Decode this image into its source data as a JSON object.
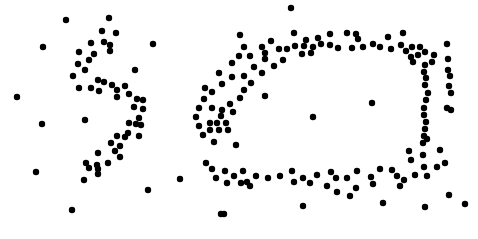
{
  "figure": {
    "title": "",
    "width": 478,
    "height": 239,
    "background_color": "#ffffff",
    "marker_color": "#000000",
    "marker_radius": 3.2
  },
  "chart_data": {
    "type": "scatter",
    "title": "",
    "subtitle": "",
    "xlabel": "",
    "ylabel": "",
    "xlim": [
      0,
      478
    ],
    "ylim": [
      239,
      0
    ],
    "grid": false,
    "legend": null,
    "axes_visible": false,
    "tick_labels_x": [],
    "tick_labels_y": [],
    "annotations": [],
    "point_color": "#000000",
    "point_marker": "circle",
    "point_size": 6.4,
    "series": [
      {
        "name": "s-curve-cluster",
        "color": "#000000",
        "points": [
          [
            66,
            20
          ],
          [
            109,
            18
          ],
          [
            102,
            31
          ],
          [
            116,
            33
          ],
          [
            104,
            42
          ],
          [
            91,
            43
          ],
          [
            110,
            45
          ],
          [
            110,
            51
          ],
          [
            79,
            52
          ],
          [
            94,
            54
          ],
          [
            89,
            60
          ],
          [
            78,
            64
          ],
          [
            85,
            70
          ],
          [
            73,
            76
          ],
          [
            98,
            80
          ],
          [
            104,
            82
          ],
          [
            112,
            85
          ],
          [
            79,
            88
          ],
          [
            91,
            88
          ],
          [
            99,
            91
          ],
          [
            117,
            90
          ],
          [
            135,
            70
          ],
          [
            125,
            86
          ],
          [
            129,
            94
          ],
          [
            117,
            97
          ],
          [
            137,
            99
          ],
          [
            143,
            100
          ],
          [
            134,
            107
          ],
          [
            143,
            109
          ],
          [
            139,
            118
          ],
          [
            129,
            123
          ],
          [
            136,
            124
          ],
          [
            141,
            125
          ],
          [
            128,
            133
          ],
          [
            139,
            136
          ],
          [
            125,
            137
          ],
          [
            117,
            136
          ],
          [
            111,
            143
          ],
          [
            120,
            146
          ],
          [
            115,
            151
          ],
          [
            98,
            153
          ],
          [
            120,
            157
          ],
          [
            86,
            163
          ],
          [
            97,
            165
          ],
          [
            108,
            163
          ],
          [
            89,
            168
          ],
          [
            98,
            169
          ],
          [
            98,
            174
          ],
          [
            84,
            180
          ]
        ]
      },
      {
        "name": "ellipse-ring-cluster",
        "color": "#000000",
        "points": [
          [
            291,
            8
          ],
          [
            294,
            33
          ],
          [
            347,
            33
          ],
          [
            330,
            34
          ],
          [
            356,
            34
          ],
          [
            403,
            33
          ],
          [
            240,
            35
          ],
          [
            306,
            40
          ],
          [
            318,
            38
          ],
          [
            271,
            41
          ],
          [
            304,
            46
          ],
          [
            358,
            39
          ],
          [
            388,
            37
          ],
          [
            313,
            47
          ],
          [
            321,
            44
          ],
          [
            295,
            46
          ],
          [
            363,
            47
          ],
          [
            330,
            45
          ],
          [
            373,
            44
          ],
          [
            380,
            47
          ],
          [
            401,
            45
          ],
          [
            412,
            47
          ],
          [
            420,
            47
          ],
          [
            244,
            47
          ],
          [
            262,
            47
          ],
          [
            279,
            49
          ],
          [
            287,
            49
          ],
          [
            338,
            48
          ],
          [
            352,
            48
          ],
          [
            391,
            49
          ],
          [
            406,
            51
          ],
          [
            425,
            52
          ],
          [
            418,
            55
          ],
          [
            265,
            53
          ],
          [
            302,
            54
          ],
          [
            311,
            53
          ],
          [
            239,
            56
          ],
          [
            250,
            56
          ],
          [
            411,
            57
          ],
          [
            447,
            44
          ],
          [
            413,
            62
          ],
          [
            434,
            55
          ],
          [
            432,
            62
          ],
          [
            425,
            65
          ],
          [
            448,
            59
          ],
          [
            424,
            72
          ],
          [
            448,
            70
          ],
          [
            450,
            76
          ],
          [
            426,
            78
          ],
          [
            425,
            85
          ],
          [
            449,
            86
          ],
          [
            451,
            93
          ],
          [
            428,
            93
          ],
          [
            426,
            100
          ],
          [
            424,
            108
          ],
          [
            447,
            108
          ],
          [
            451,
            110
          ],
          [
            424,
            115
          ],
          [
            426,
            122
          ],
          [
            425,
            129
          ],
          [
            424,
            136
          ],
          [
            427,
            139
          ],
          [
            423,
            143
          ],
          [
            409,
            151
          ],
          [
            423,
            155
          ],
          [
            440,
            150
          ],
          [
            411,
            160
          ],
          [
            424,
            167
          ],
          [
            437,
            167
          ],
          [
            445,
            163
          ],
          [
            415,
            175
          ],
          [
            427,
            176
          ],
          [
            397,
            176
          ],
          [
            404,
            180
          ],
          [
            380,
            169
          ],
          [
            392,
            170
          ],
          [
            371,
            177
          ],
          [
            357,
            171
          ],
          [
            347,
            178
          ],
          [
            331,
            172
          ],
          [
            336,
            178
          ],
          [
            317,
            175
          ],
          [
            303,
            178
          ],
          [
            292,
            171
          ],
          [
            280,
            176
          ],
          [
            268,
            178
          ],
          [
            256,
            176
          ],
          [
            247,
            182
          ],
          [
            243,
            171
          ],
          [
            234,
            176
          ],
          [
            225,
            171
          ],
          [
            216,
            178
          ],
          [
            212,
            169
          ],
          [
            206,
            163
          ],
          [
            227,
            183
          ],
          [
            241,
            183
          ],
          [
            250,
            186
          ],
          [
            294,
            182
          ],
          [
            310,
            183
          ],
          [
            327,
            186
          ],
          [
            356,
            188
          ],
          [
            373,
            184
          ],
          [
            400,
            186
          ],
          [
            350,
            196
          ],
          [
            337,
            192
          ],
          [
            303,
            206
          ],
          [
            383,
            203
          ],
          [
            425,
            207
          ],
          [
            449,
            195
          ],
          [
            465,
            204
          ],
          [
            236,
            145
          ],
          [
            214,
            142
          ],
          [
            203,
            135
          ],
          [
            199,
            126
          ],
          [
            196,
            117
          ],
          [
            199,
            108
          ],
          [
            204,
            99
          ],
          [
            212,
            92
          ],
          [
            222,
            84
          ],
          [
            232,
            77
          ],
          [
            210,
            123
          ],
          [
            217,
            123
          ],
          [
            226,
            123
          ],
          [
            210,
            130
          ],
          [
            219,
            130
          ],
          [
            228,
            130
          ],
          [
            212,
            108
          ],
          [
            222,
            110
          ],
          [
            221,
            116
          ],
          [
            233,
            112
          ],
          [
            230,
            104
          ],
          [
            240,
            98
          ],
          [
            244,
            90
          ],
          [
            251,
            83
          ],
          [
            262,
            73
          ],
          [
            274,
            66
          ],
          [
            283,
            60
          ],
          [
            254,
            67
          ],
          [
            265,
            59
          ],
          [
            244,
            76
          ],
          [
            205,
            88
          ],
          [
            219,
            73
          ],
          [
            232,
            63
          ]
        ]
      },
      {
        "name": "noise-outliers",
        "color": "#000000",
        "points": [
          [
            17,
            97
          ],
          [
            43,
            47
          ],
          [
            42,
            124
          ],
          [
            36,
            172
          ],
          [
            85,
            120
          ],
          [
            72,
            210
          ],
          [
            153,
            44
          ],
          [
            148,
            190
          ],
          [
            180,
            179
          ],
          [
            221,
            214
          ],
          [
            265,
            96
          ],
          [
            313,
            117
          ],
          [
            372,
            103
          ],
          [
            224,
            214
          ]
        ]
      }
    ]
  }
}
